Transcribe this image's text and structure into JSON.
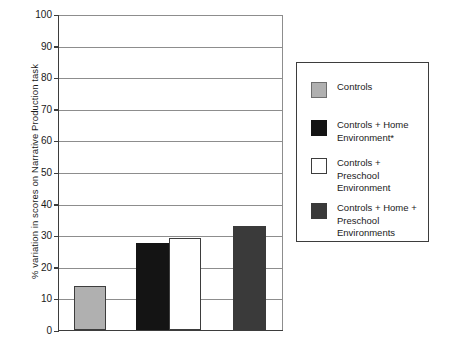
{
  "chart_data": {
    "type": "bar",
    "title": "",
    "xlabel": "",
    "ylabel": "% variation in scores on Narrative Production task",
    "ylim": [
      0,
      100
    ],
    "yticks": [
      0,
      10,
      20,
      30,
      40,
      50,
      60,
      70,
      80,
      90,
      100
    ],
    "grid": true,
    "legend_position": "right",
    "categories": [
      "Controls",
      "Controls + Home Environment*",
      "Controls + Preschool Environment",
      "Controls + Home + Preschool Environments"
    ],
    "values": [
      14,
      27.5,
      29,
      33
    ],
    "colors": [
      "#b0b0b0",
      "#141414",
      "#ffffff",
      "#3a3a3a"
    ]
  },
  "axis": {
    "y_title": "% variation in scores on Narrative Production task",
    "ticks": [
      {
        "value": 100,
        "label": "100"
      },
      {
        "value": 90,
        "label": "90"
      },
      {
        "value": 80,
        "label": "80"
      },
      {
        "value": 70,
        "label": "70"
      },
      {
        "value": 60,
        "label": "60"
      },
      {
        "value": 50,
        "label": "50"
      },
      {
        "value": 40,
        "label": "40"
      },
      {
        "value": 30,
        "label": "30"
      },
      {
        "value": 20,
        "label": "20"
      },
      {
        "value": 10,
        "label": "10"
      },
      {
        "value": 0,
        "label": "0"
      }
    ]
  },
  "bars": [
    {
      "name": "controls",
      "value": 14,
      "color": "#b0b0b0",
      "border": "#3d3d3d",
      "x": 73,
      "width": 32
    },
    {
      "name": "home-environment",
      "value": 27.5,
      "color": "#141414",
      "border": "#141414",
      "x": 135,
      "width": 33
    },
    {
      "name": "preschool-environment",
      "value": 29,
      "color": "#ffffff",
      "border": "#3d3d3d",
      "x": 168,
      "width": 32
    },
    {
      "name": "home-preschool",
      "value": 33,
      "color": "#3a3a3a",
      "border": "#3a3a3a",
      "x": 232,
      "width": 33
    }
  ],
  "legend": {
    "items": [
      {
        "swatch": "#b0b0b0",
        "border": "#6e6e6e",
        "label": "Controls",
        "top": 18
      },
      {
        "swatch": "#141414",
        "border": "#141414",
        "label": "Controls + Home\nEnvironment*",
        "top": 56
      },
      {
        "swatch": "#ffffff",
        "border": "#3d3d3d",
        "label": "Controls +\nPreschool\nEnvironment",
        "top": 94
      },
      {
        "swatch": "#3a3a3a",
        "border": "#3a3a3a",
        "label": "Controls + Home +\nPreschool\nEnvironments",
        "top": 139
      }
    ]
  }
}
